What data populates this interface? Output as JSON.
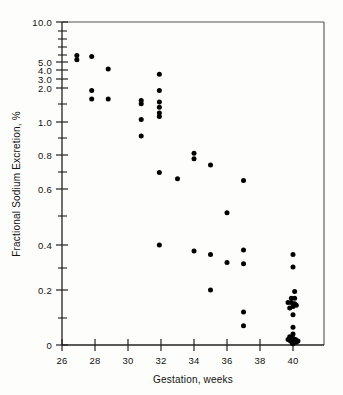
{
  "chart_data": {
    "type": "scatter",
    "title": "",
    "xlabel": "Gestation, weeks",
    "ylabel": "Fractional Sodium Excretion, %",
    "xlim": [
      26,
      41.5
    ],
    "ylim": [
      0,
      10.0
    ],
    "yscale": "log-like-compressed",
    "grid": false,
    "legend": "none",
    "marker": {
      "shape": "circle",
      "color": "#000000",
      "size_px": 5
    },
    "xticks": [
      26,
      28,
      30,
      32,
      34,
      36,
      38,
      40
    ],
    "xtick_labels": [
      "26",
      "28",
      "30",
      "32",
      "34",
      "36",
      "38",
      "40"
    ],
    "yticks": [
      10.0,
      5.0,
      4.0,
      3.0,
      2.0,
      1.0,
      0.8,
      0.6,
      0.4,
      0.2,
      0
    ],
    "ytick_labels": [
      "10.0",
      "5.0",
      "4.0",
      "3.0",
      "2.0",
      "1.0",
      "0.8",
      "0.6",
      "0.4",
      "0.2",
      "0"
    ],
    "yminor_ticks": [
      9.0,
      8.0,
      7.0,
      6.0,
      1.5,
      0.9,
      0.7,
      0.5,
      0.3,
      0.1
    ],
    "n_points": 57,
    "points": [
      {
        "x": 26.9,
        "y": 5.6
      },
      {
        "x": 26.9,
        "y": 5.2
      },
      {
        "x": 27.8,
        "y": 5.5
      },
      {
        "x": 28.8,
        "y": 4.1
      },
      {
        "x": 27.8,
        "y": 1.9
      },
      {
        "x": 27.8,
        "y": 1.6
      },
      {
        "x": 28.8,
        "y": 1.6
      },
      {
        "x": 30.8,
        "y": 1.55
      },
      {
        "x": 30.8,
        "y": 1.45
      },
      {
        "x": 30.8,
        "y": 1.05
      },
      {
        "x": 30.8,
        "y": 0.91
      },
      {
        "x": 31.9,
        "y": 3.5
      },
      {
        "x": 31.9,
        "y": 1.9
      },
      {
        "x": 31.9,
        "y": 1.5
      },
      {
        "x": 31.9,
        "y": 1.35
      },
      {
        "x": 31.9,
        "y": 1.2
      },
      {
        "x": 31.9,
        "y": 1.12
      },
      {
        "x": 31.9,
        "y": 0.69
      },
      {
        "x": 31.9,
        "y": 0.4
      },
      {
        "x": 33.0,
        "y": 0.655
      },
      {
        "x": 34.0,
        "y": 0.81
      },
      {
        "x": 34.0,
        "y": 0.775
      },
      {
        "x": 35.0,
        "y": 0.735
      },
      {
        "x": 36.0,
        "y": 0.505
      },
      {
        "x": 37.0,
        "y": 0.645
      },
      {
        "x": 34.0,
        "y": 0.365
      },
      {
        "x": 35.0,
        "y": 0.345
      },
      {
        "x": 36.0,
        "y": 0.305
      },
      {
        "x": 37.0,
        "y": 0.37
      },
      {
        "x": 37.0,
        "y": 0.3
      },
      {
        "x": 35.0,
        "y": 0.2
      },
      {
        "x": 37.0,
        "y": 0.12
      },
      {
        "x": 37.0,
        "y": 0.07
      },
      {
        "x": 40.0,
        "y": 0.345
      },
      {
        "x": 40.0,
        "y": 0.285
      },
      {
        "x": 40.1,
        "y": 0.195
      },
      {
        "x": 39.9,
        "y": 0.17
      },
      {
        "x": 40.1,
        "y": 0.17
      },
      {
        "x": 39.7,
        "y": 0.155
      },
      {
        "x": 39.9,
        "y": 0.155
      },
      {
        "x": 40.1,
        "y": 0.15
      },
      {
        "x": 40.0,
        "y": 0.14
      },
      {
        "x": 40.2,
        "y": 0.145
      },
      {
        "x": 39.8,
        "y": 0.135
      },
      {
        "x": 40.0,
        "y": 0.11
      },
      {
        "x": 40.0,
        "y": 0.065
      },
      {
        "x": 40.0,
        "y": 0.04
      },
      {
        "x": 39.8,
        "y": 0.03
      },
      {
        "x": 40.0,
        "y": 0.025
      },
      {
        "x": 40.15,
        "y": 0.02
      },
      {
        "x": 39.85,
        "y": 0.015
      },
      {
        "x": 40.05,
        "y": 0.012
      },
      {
        "x": 39.95,
        "y": 0.008
      },
      {
        "x": 40.2,
        "y": 0.01
      },
      {
        "x": 39.7,
        "y": 0.02
      },
      {
        "x": 40.3,
        "y": 0.015
      },
      {
        "x": 40.0,
        "y": 0.005
      }
    ]
  },
  "axes": {
    "x_title": "Gestation, weeks",
    "y_title": "Fractional Sodium Excretion, %"
  }
}
